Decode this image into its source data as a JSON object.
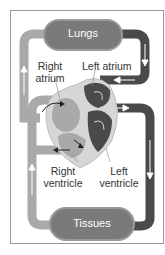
{
  "diagram": {
    "organs": {
      "top": "Lungs",
      "bottom": "Tissues"
    },
    "labels": {
      "right_atrium_line1": "Right",
      "right_atrium_line2": "atrium",
      "left_atrium": "Left atrium",
      "right_ventricle_line1": "Right",
      "right_ventricle_line2": "ventricle",
      "left_ventricle_line1": "Left",
      "left_ventricle_line2": "ventricle"
    },
    "colors": {
      "deoxygenated": "#a9a9a9",
      "oxygenated": "#4a4a4a",
      "organ_fill": "#7a7a7a",
      "heart_outline": "#d6d6d6",
      "frame": "#9a9a9a"
    }
  }
}
